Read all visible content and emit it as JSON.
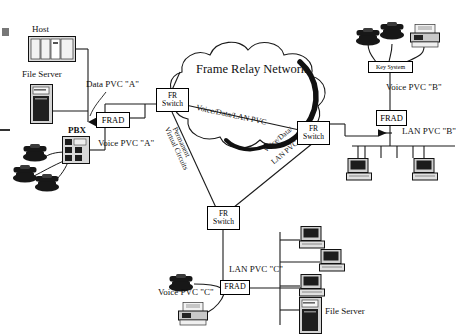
{
  "diagram": {
    "title": "Frame Relay Network",
    "cloud_label": "Frame Relay Network",
    "pvc_labels": {
      "top_diagonal": "Voice/Data/LAN PVC",
      "left_vertical_line1": "Permanent",
      "left_vertical_line2": "Virtual Circuits",
      "right_diagonal_line1": "Voice/Data/",
      "right_diagonal_line2": "LAN PVC"
    },
    "switches": [
      {
        "name": "fr-switch-left",
        "line1": "FR",
        "line2": "Switch"
      },
      {
        "name": "fr-switch-right",
        "line1": "FR",
        "line2": "Switch"
      },
      {
        "name": "fr-switch-bottom",
        "line1": "FR",
        "line2": "Switch"
      }
    ],
    "site_a": {
      "host_label": "Host",
      "file_server_label": "File Server",
      "pbx_label": "PBX",
      "frad_label": "FRAD",
      "data_pvc_label": "Data PVC  \"A\"",
      "voice_pvc_label": "Voice PVC \"A\"",
      "phone_count": 3
    },
    "site_b": {
      "key_system_label": "Key System",
      "frad_label": "FRAD",
      "voice_pvc_label": "Voice PVC \"B\"",
      "lan_pvc_label": "LAN PVC \"B\"",
      "phone_count": 2,
      "fax_count": 1,
      "workstation_count": 2
    },
    "site_c": {
      "frad_label": "FRAD",
      "voice_pvc_label": "Voice PVC \"C\"",
      "lan_pvc_label": "LAN PVC \"C\"",
      "file_server_label": "File Server",
      "phone_count": 1,
      "fax_count": 1,
      "workstation_count": 3
    },
    "colors": {
      "line": "#1a1a1a",
      "device_fill": "#d9d9d9",
      "device_dark": "#262626",
      "background": "#ffffff"
    }
  }
}
